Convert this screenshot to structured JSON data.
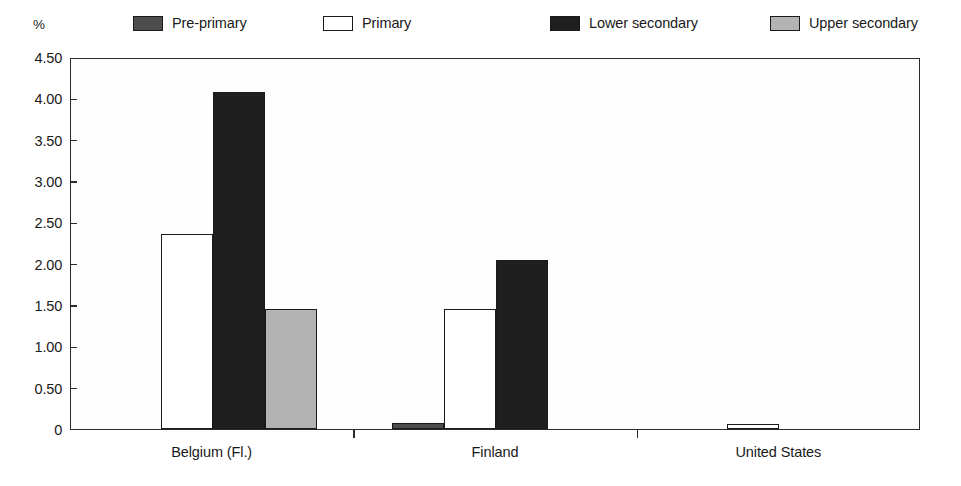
{
  "chart_data": {
    "type": "bar",
    "title": "",
    "subtitle": "",
    "xlabel": "",
    "ylabel": "%",
    "unit_label": "%",
    "categories": [
      "Belgium (Fl.)",
      "Finland",
      "United States"
    ],
    "series": [
      {
        "name": "Pre-primary",
        "color": "#4d4d4d",
        "values": [
          0,
          0.07,
          0
        ]
      },
      {
        "name": "Primary",
        "color": "#ffffff",
        "values": [
          2.36,
          1.45,
          0.06
        ]
      },
      {
        "name": "Lower secondary",
        "color": "#1f1f1f",
        "values": [
          4.08,
          2.04,
          0
        ]
      },
      {
        "name": "Upper secondary",
        "color": "#b3b3b3",
        "values": [
          1.45,
          0,
          0
        ]
      }
    ],
    "ylim": [
      0,
      4.5
    ],
    "ytick_values": [
      0,
      0.5,
      1.0,
      1.5,
      2.0,
      2.5,
      3.0,
      3.5,
      4.0,
      4.5
    ],
    "ytick_labels": [
      "0",
      "0.50",
      "1.00",
      "1.50",
      "2.00",
      "2.50",
      "3.00",
      "3.50",
      "4.00",
      "4.50"
    ],
    "grid": false,
    "legend_position": "top",
    "frame_color": "#2b2b2b",
    "bar_edge_color": "#1a1a1a",
    "background_color": "#ffffff"
  },
  "legend": {
    "items": [
      {
        "label": "Pre-primary",
        "color": "#4d4d4d"
      },
      {
        "label": "Primary",
        "color": "#ffffff"
      },
      {
        "label": "Lower secondary",
        "color": "#1f1f1f"
      },
      {
        "label": "Upper secondary",
        "color": "#b3b3b3"
      }
    ]
  }
}
